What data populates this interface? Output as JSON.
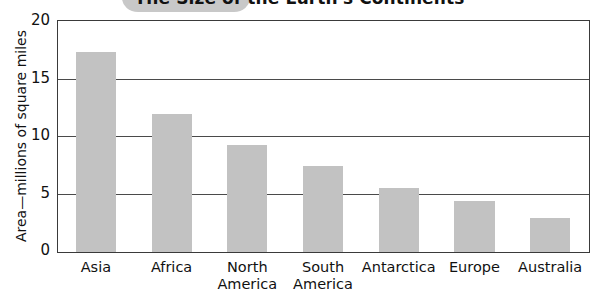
{
  "chart_data": {
    "type": "bar",
    "title": "The Size of the Earth's Continents",
    "xlabel": "",
    "ylabel": "Area—millions of square miles",
    "categories": [
      "Asia",
      "Africa",
      "North America",
      "South America",
      "Antarctica",
      "Europe",
      "Australia"
    ],
    "category_lines": [
      [
        "Asia"
      ],
      [
        "Africa"
      ],
      [
        "North",
        "America"
      ],
      [
        "South",
        "America"
      ],
      [
        "Antarctica"
      ],
      [
        "Europe"
      ],
      [
        "Australia"
      ]
    ],
    "values": [
      17.4,
      12.0,
      9.3,
      7.5,
      5.6,
      4.4,
      3.0
    ],
    "ylim": [
      0,
      20
    ],
    "ytick_labels": [
      "20",
      "15",
      "10",
      "5",
      "0"
    ],
    "ytick_values": [
      20,
      15,
      10,
      5,
      0
    ],
    "grid": true,
    "grid_axis": "y",
    "legend": false,
    "legend_position": "none",
    "bar_color": "#c2c2c2",
    "axis_color": "#3a3a3a",
    "background_color": "#ffffff"
  },
  "decor": {
    "title_blob_color": "#c8c8c8"
  }
}
